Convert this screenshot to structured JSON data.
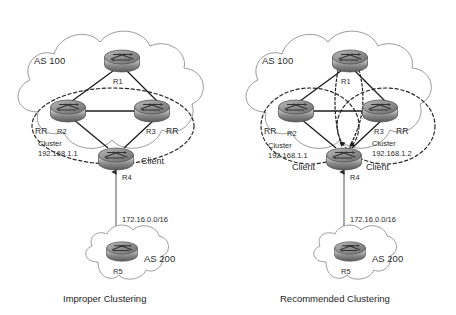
{
  "figure": {
    "background": "#ffffff",
    "line_color": "#1d1d1d",
    "cloud_stroke": "#8e8e8e",
    "dashed_color": "#2a2a2a"
  },
  "panels": [
    {
      "id": "left",
      "caption": "Improper Clustering",
      "as_top_label": "AS 100",
      "as_bottom_label": "AS 200",
      "wan_link_label": "172.16.0.0/16",
      "clusters": [
        {
          "name_label": "Cluster",
          "id_label": "192.168.1.1"
        }
      ],
      "routers": [
        {
          "name": "R1",
          "role": ""
        },
        {
          "name": "R2",
          "role": "RR"
        },
        {
          "name": "R3",
          "role": "RR"
        },
        {
          "name": "R4",
          "role": "Client"
        },
        {
          "name": "R5",
          "role": ""
        }
      ]
    },
    {
      "id": "right",
      "caption": "Recommended Clustering",
      "as_top_label": "AS 100",
      "as_bottom_label": "AS 200",
      "wan_link_label": "172.16.0.0/16",
      "clusters": [
        {
          "name_label": "Cluster",
          "id_label": "192.168.1.1"
        },
        {
          "name_label": "Cluster",
          "id_label": "192.168.1.2"
        }
      ],
      "routers": [
        {
          "name": "R1",
          "role": ""
        },
        {
          "name": "R2",
          "role": "RR"
        },
        {
          "name": "R3",
          "role": "RR"
        },
        {
          "name": "R4",
          "role": "Client"
        },
        {
          "name": "R5",
          "role": ""
        }
      ],
      "client_label_left": "Client",
      "client_label_right": "Client"
    }
  ]
}
